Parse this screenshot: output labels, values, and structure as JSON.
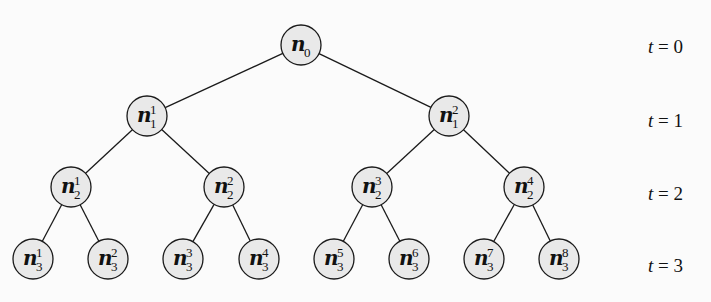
{
  "diagram": {
    "type": "binary-tree",
    "node_fill": "#e9e9e9",
    "stroke_color": "#1a1a1a",
    "nodes": [
      {
        "id": "n0",
        "base": "n",
        "sub": "0",
        "sup": "",
        "level": 0,
        "x": 301,
        "y": 45
      },
      {
        "id": "n1_1",
        "base": "n",
        "sub": "1",
        "sup": "1",
        "level": 1,
        "x": 147,
        "y": 116
      },
      {
        "id": "n1_2",
        "base": "n",
        "sub": "1",
        "sup": "2",
        "level": 1,
        "x": 449,
        "y": 116
      },
      {
        "id": "n2_1",
        "base": "n",
        "sub": "2",
        "sup": "1",
        "level": 2,
        "x": 71,
        "y": 187
      },
      {
        "id": "n2_2",
        "base": "n",
        "sub": "2",
        "sup": "2",
        "level": 2,
        "x": 224,
        "y": 187
      },
      {
        "id": "n2_3",
        "base": "n",
        "sub": "2",
        "sup": "3",
        "level": 2,
        "x": 372,
        "y": 187
      },
      {
        "id": "n2_4",
        "base": "n",
        "sub": "2",
        "sup": "4",
        "level": 2,
        "x": 524,
        "y": 187
      },
      {
        "id": "n3_1",
        "base": "n",
        "sub": "3",
        "sup": "1",
        "level": 3,
        "x": 33,
        "y": 259
      },
      {
        "id": "n3_2",
        "base": "n",
        "sub": "3",
        "sup": "2",
        "level": 3,
        "x": 108,
        "y": 259
      },
      {
        "id": "n3_3",
        "base": "n",
        "sub": "3",
        "sup": "3",
        "level": 3,
        "x": 183,
        "y": 259
      },
      {
        "id": "n3_4",
        "base": "n",
        "sub": "3",
        "sup": "4",
        "level": 3,
        "x": 259,
        "y": 259
      },
      {
        "id": "n3_5",
        "base": "n",
        "sub": "3",
        "sup": "5",
        "level": 3,
        "x": 334,
        "y": 259
      },
      {
        "id": "n3_6",
        "base": "n",
        "sub": "3",
        "sup": "6",
        "level": 3,
        "x": 409,
        "y": 259
      },
      {
        "id": "n3_7",
        "base": "n",
        "sub": "3",
        "sup": "7",
        "level": 3,
        "x": 484,
        "y": 259
      },
      {
        "id": "n3_8",
        "base": "n",
        "sub": "3",
        "sup": "8",
        "level": 3,
        "x": 559,
        "y": 259
      }
    ],
    "edges": [
      [
        "n0",
        "n1_1"
      ],
      [
        "n0",
        "n1_2"
      ],
      [
        "n1_1",
        "n2_1"
      ],
      [
        "n1_1",
        "n2_2"
      ],
      [
        "n1_2",
        "n2_3"
      ],
      [
        "n1_2",
        "n2_4"
      ],
      [
        "n2_1",
        "n3_1"
      ],
      [
        "n2_1",
        "n3_2"
      ],
      [
        "n2_2",
        "n3_3"
      ],
      [
        "n2_2",
        "n3_4"
      ],
      [
        "n2_3",
        "n3_5"
      ],
      [
        "n2_3",
        "n3_6"
      ],
      [
        "n2_4",
        "n3_7"
      ],
      [
        "n2_4",
        "n3_8"
      ]
    ],
    "time_labels": [
      {
        "var": "t",
        "eq": " = ",
        "value": "0",
        "y": 53
      },
      {
        "var": "t",
        "eq": " = ",
        "value": "1",
        "y": 127
      },
      {
        "var": "t",
        "eq": " = ",
        "value": "2",
        "y": 200
      },
      {
        "var": "t",
        "eq": " = ",
        "value": "3",
        "y": 272
      }
    ]
  }
}
